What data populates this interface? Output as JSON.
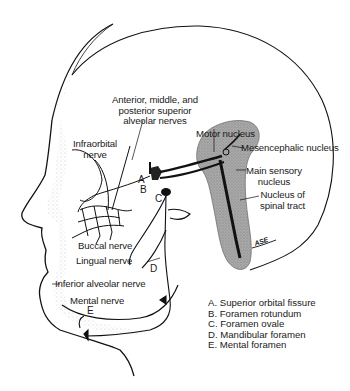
{
  "figure": {
    "labels": {
      "sup_alveolar": [
        "Anterior, middle, and",
        "posterior superior",
        "alveolar nerves"
      ],
      "infraorbital": [
        "Infraorbital",
        "nerve"
      ],
      "motor_nucleus": "Motor nucleus",
      "mesencephalic_nucleus": "Mesencephalic nucleus",
      "main_sensory": [
        "Main sensory",
        "nucleus"
      ],
      "spinal_tract": [
        "Nucleus of",
        "spinal tract"
      ],
      "buccal": "Buccal nerve",
      "lingual": "Lingual nerve",
      "inferior_alveolar": "Inferior alveolar nerve",
      "mental": "Mental nerve"
    },
    "letters": {
      "A": "A",
      "B": "B",
      "C": "C",
      "D": "D",
      "E": "E"
    },
    "legend": [
      "A. Superior orbital fissure",
      "B. Foramen rotundum",
      "C. Foramen ovale",
      "D. Mandibular foramen",
      "E. Mental foramen"
    ],
    "signature": "ASE",
    "colors": {
      "line": "#111111",
      "brainstem_fill": "#9a9a9a",
      "stipple": "#b5b5b5",
      "background": "#ffffff"
    }
  }
}
